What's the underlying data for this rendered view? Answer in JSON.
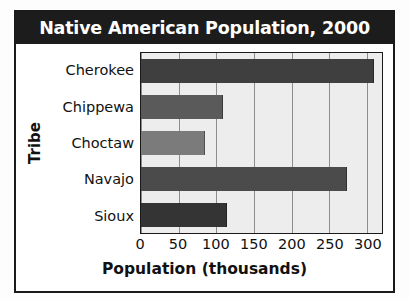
{
  "chart_data": {
    "type": "bar",
    "orientation": "horizontal",
    "title": "Native American Population, 2000",
    "xlabel": "Population (thousands)",
    "ylabel": "Tribe",
    "categories": [
      "Cherokee",
      "Chippewa",
      "Choctaw",
      "Navajo",
      "Sioux"
    ],
    "values": [
      308,
      108,
      84,
      272,
      113
    ],
    "bar_colors": [
      "#3f3f3f",
      "#5a5a5a",
      "#7b7b7b",
      "#4b4b4b",
      "#343434"
    ],
    "xticks": [
      0,
      50,
      100,
      150,
      200,
      250,
      300
    ],
    "xtick_labels": [
      "0",
      "50",
      "100",
      "150",
      "200",
      "250",
      "300"
    ],
    "xlim": [
      0,
      320
    ],
    "grid": true,
    "grid_axis": "x",
    "legend": null,
    "plot_bgcolor": "#ededed",
    "title_bg": "#1c1c1c",
    "title_color": "#ffffff",
    "axis_color": "#1a1a1a"
  }
}
